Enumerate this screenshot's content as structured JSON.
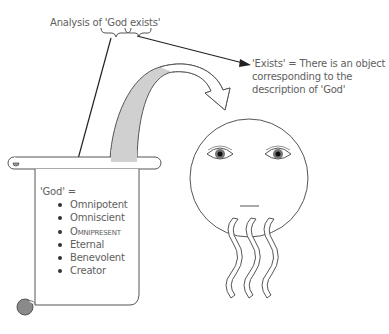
{
  "diagram": {
    "title": "Analysis of 'God exists'",
    "exists_definition": {
      "lines": [
        "'Exists' = There is an object",
        "corresponding to the",
        "description of 'God'"
      ]
    },
    "god_definition": {
      "heading": "'God' =",
      "attributes": [
        "Omnipotent",
        "Omniscient",
        "Omnipresent",
        "Eternal",
        "Benevolent",
        "Creator"
      ]
    },
    "figures": {
      "scroll": "parchment-scroll",
      "face": "bearded-god-face",
      "curved_arrow": "from-scroll-to-face"
    },
    "colors": {
      "stroke": "#555555",
      "arrow_fill": "#d0d0d0",
      "text": "#606060"
    }
  }
}
